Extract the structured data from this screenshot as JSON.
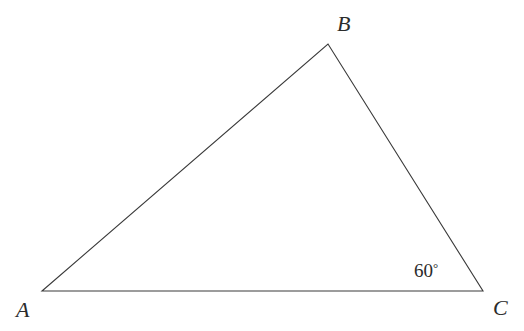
{
  "figure": {
    "type": "triangle-diagram",
    "background_color": "#ffffff",
    "stroke_color": "#3a3a3a",
    "stroke_width": 1.1,
    "width": 524,
    "height": 331
  },
  "vertices": [
    {
      "name": "A",
      "label": "A",
      "x": 42,
      "y": 291
    },
    {
      "name": "B",
      "label": "B",
      "x": 328,
      "y": 44
    },
    {
      "name": "C",
      "label": "C",
      "x": 483,
      "y": 291
    }
  ],
  "edges": [
    {
      "name": "AB",
      "from": "A",
      "to": "B"
    },
    {
      "name": "BC",
      "from": "B",
      "to": "C"
    },
    {
      "name": "CA",
      "from": "C",
      "to": "A"
    }
  ],
  "angles": [
    {
      "at_vertex": "C",
      "value": "60",
      "degree_symbol": "°",
      "text": "60°"
    }
  ],
  "polygon_points": "42,291 328,44 483,291"
}
